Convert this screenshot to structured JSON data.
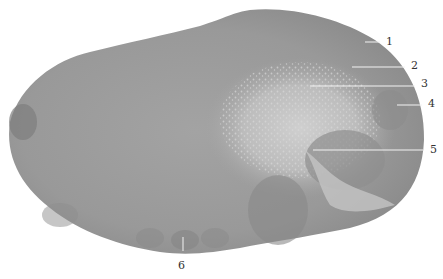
{
  "figure": {
    "labels": [
      {
        "id": "1",
        "text": "1",
        "x": 386,
        "y": 36
      },
      {
        "id": "2",
        "text": "2",
        "x": 411,
        "y": 60
      },
      {
        "id": "3",
        "text": "3",
        "x": 421,
        "y": 78
      },
      {
        "id": "4",
        "text": "4",
        "x": 428,
        "y": 98
      },
      {
        "id": "5",
        "text": "5",
        "x": 430,
        "y": 144
      },
      {
        "id": "6",
        "text": "6",
        "x": 178,
        "y": 260
      }
    ],
    "colors": {
      "background": "#ffffff",
      "tissue_dark": "#8a8a8a",
      "tissue_mid": "#9c9c9c",
      "tissue_light": "#c8c8c8",
      "leader_line": "#f2f2f2"
    }
  }
}
